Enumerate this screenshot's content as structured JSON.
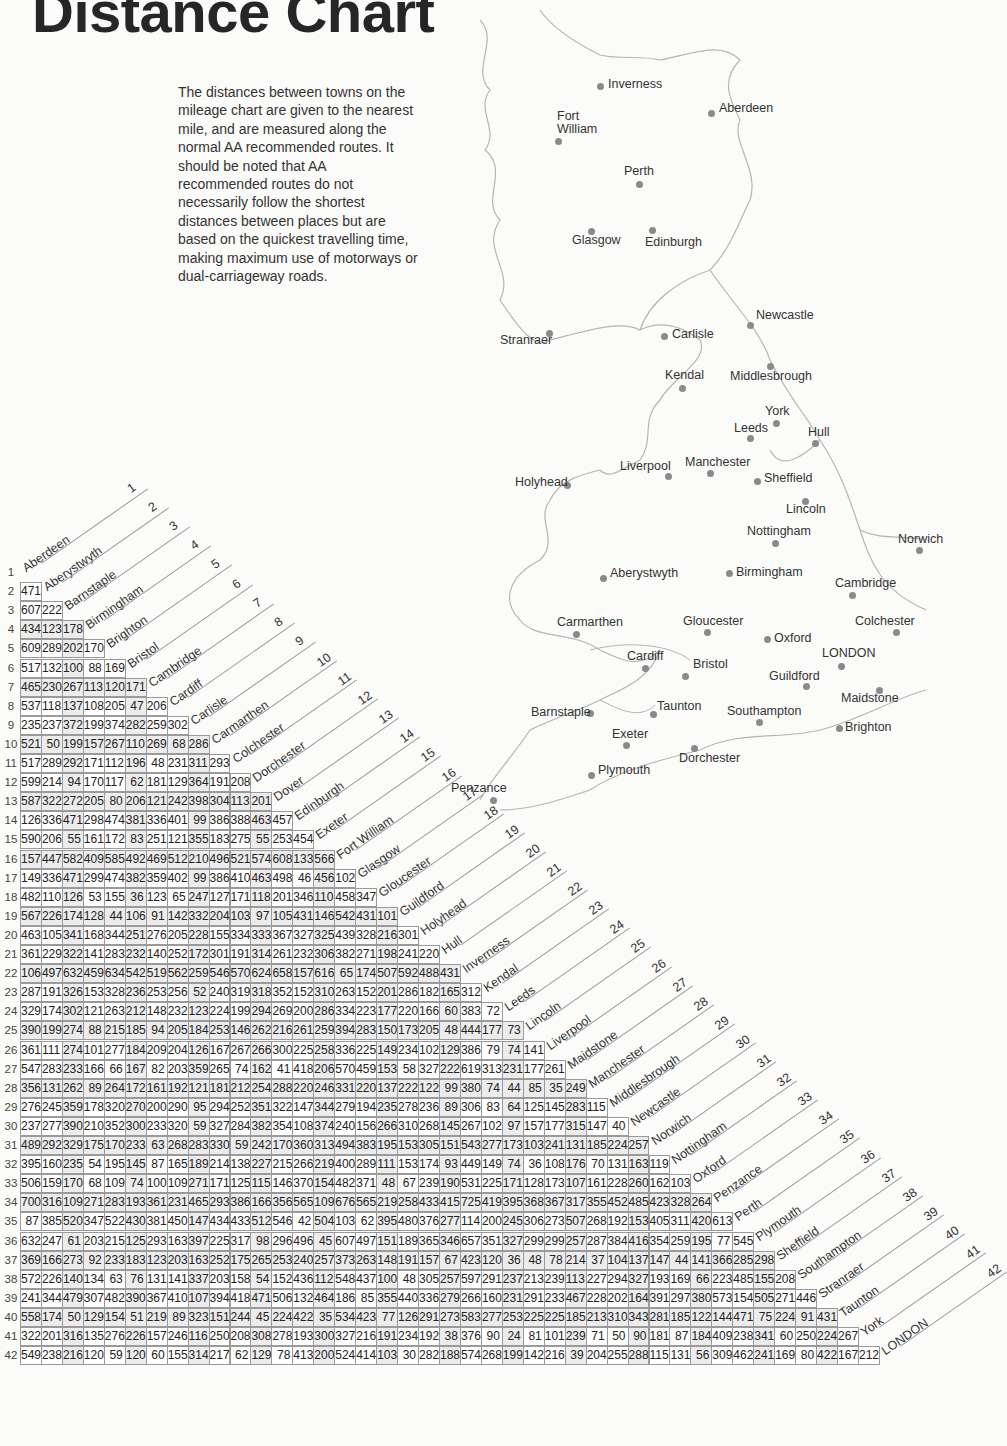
{
  "title": "Distance Chart",
  "intro": "The distances between towns on the mileage chart are given to the nearest mile, and are measured along the normal AA recommended routes. It should be noted  that AA recommended routes do not necessarily follow the shortest distances between places but are based on the quickest travelling time, making maximum use of motorways or dual-carriageway roads.",
  "map": {
    "towns": [
      {
        "name": "Inverness",
        "x": 600,
        "y": 86,
        "lx": 608,
        "ly": 78
      },
      {
        "name": "Aberdeen",
        "x": 711,
        "y": 113,
        "lx": 719,
        "ly": 102
      },
      {
        "name": "Fort\nWilliam",
        "x": 558,
        "y": 141,
        "lx": 557,
        "ly": 110
      },
      {
        "name": "Perth",
        "x": 639,
        "y": 184,
        "lx": 624,
        "ly": 165
      },
      {
        "name": "Glasgow",
        "x": 591,
        "y": 231,
        "lx": 572,
        "ly": 234
      },
      {
        "name": "Edinburgh",
        "x": 652,
        "y": 230,
        "lx": 645,
        "ly": 236
      },
      {
        "name": "Newcastle",
        "x": 750,
        "y": 325,
        "lx": 756,
        "ly": 309
      },
      {
        "name": "Stranraer",
        "x": 549,
        "y": 333,
        "lx": 500,
        "ly": 334
      },
      {
        "name": "Carlisle",
        "x": 664,
        "y": 336,
        "lx": 672,
        "ly": 328
      },
      {
        "name": "Kendal",
        "x": 682,
        "y": 388,
        "lx": 665,
        "ly": 369
      },
      {
        "name": "Middlesbrough",
        "x": 770,
        "y": 366,
        "lx": 730,
        "ly": 370
      },
      {
        "name": "York",
        "x": 776,
        "y": 423,
        "lx": 765,
        "ly": 405
      },
      {
        "name": "Leeds",
        "x": 750,
        "y": 438,
        "lx": 734,
        "ly": 422
      },
      {
        "name": "Hull",
        "x": 815,
        "y": 443,
        "lx": 808,
        "ly": 426
      },
      {
        "name": "Liverpool",
        "x": 668,
        "y": 476,
        "lx": 620,
        "ly": 460
      },
      {
        "name": "Manchester",
        "x": 710,
        "y": 473,
        "lx": 685,
        "ly": 456
      },
      {
        "name": "Sheffield",
        "x": 757,
        "y": 481,
        "lx": 764,
        "ly": 472
      },
      {
        "name": "Holyhead",
        "x": 567,
        "y": 485,
        "lx": 515,
        "ly": 476
      },
      {
        "name": "Lincoln",
        "x": 805,
        "y": 501,
        "lx": 786,
        "ly": 503
      },
      {
        "name": "Nottingham",
        "x": 775,
        "y": 543,
        "lx": 747,
        "ly": 525
      },
      {
        "name": "Norwich",
        "x": 919,
        "y": 550,
        "lx": 898,
        "ly": 533
      },
      {
        "name": "Aberystwyth",
        "x": 603,
        "y": 578,
        "lx": 610,
        "ly": 567
      },
      {
        "name": "Birmingham",
        "x": 729,
        "y": 573,
        "lx": 736,
        "ly": 566
      },
      {
        "name": "Cambridge",
        "x": 852,
        "y": 595,
        "lx": 835,
        "ly": 577
      },
      {
        "name": "Carmarthen",
        "x": 576,
        "y": 634,
        "lx": 557,
        "ly": 616
      },
      {
        "name": "Gloucester",
        "x": 707,
        "y": 632,
        "lx": 683,
        "ly": 615
      },
      {
        "name": "Colchester",
        "x": 896,
        "y": 632,
        "lx": 855,
        "ly": 615
      },
      {
        "name": "Oxford",
        "x": 767,
        "y": 639,
        "lx": 774,
        "ly": 632
      },
      {
        "name": "LONDON",
        "x": 841,
        "y": 666,
        "lx": 822,
        "ly": 647
      },
      {
        "name": "Cardiff",
        "x": 645,
        "y": 668,
        "lx": 627,
        "ly": 650
      },
      {
        "name": "Bristol",
        "x": 685,
        "y": 676,
        "lx": 693,
        "ly": 658
      },
      {
        "name": "Guildford",
        "x": 806,
        "y": 686,
        "lx": 769,
        "ly": 670
      },
      {
        "name": "Maidstone",
        "x": 879,
        "y": 690,
        "lx": 841,
        "ly": 692
      },
      {
        "name": "Barnstaple",
        "x": 590,
        "y": 713,
        "lx": 531,
        "ly": 706
      },
      {
        "name": "Taunton",
        "x": 653,
        "y": 714,
        "lx": 657,
        "ly": 700
      },
      {
        "name": "Southampton",
        "x": 759,
        "y": 722,
        "lx": 727,
        "ly": 705
      },
      {
        "name": "Brighton",
        "x": 839,
        "y": 728,
        "lx": 845,
        "ly": 721
      },
      {
        "name": "Exeter",
        "x": 626,
        "y": 745,
        "lx": 612,
        "ly": 728
      },
      {
        "name": "Dorchester",
        "x": 694,
        "y": 748,
        "lx": 679,
        "ly": 752
      },
      {
        "name": "Plymouth",
        "x": 591,
        "y": 775,
        "lx": 598,
        "ly": 764
      },
      {
        "name": "Penzance",
        "x": 493,
        "y": 800,
        "lx": 451,
        "ly": 782
      }
    ]
  },
  "chart_data": {
    "type": "table",
    "title": "Distance Chart",
    "unit": "miles",
    "towns": [
      "Aberdeen",
      "Aberystwyth",
      "Barnstaple",
      "Birmingham",
      "Brighton",
      "Bristol",
      "Cambridge",
      "Cardiff",
      "Carlisle",
      "Carmarthen",
      "Colchester",
      "Dorchester",
      "Dover",
      "Edinburgh",
      "Exeter",
      "Fort William",
      "Glasgow",
      "Gloucester",
      "Guildford",
      "Holyhead",
      "Hull",
      "Inverness",
      "Kendal",
      "Leeds",
      "Lincoln",
      "Liverpool",
      "Maidstone",
      "Manchester",
      "Middlesbrough",
      "Newcastle",
      "Norwich",
      "Nottingham",
      "Oxford",
      "Penzance",
      "Perth",
      "Plymouth",
      "Sheffield",
      "Southampton",
      "Stranraer",
      "Taunton",
      "York",
      "LONDON"
    ],
    "rows": [
      [],
      [
        471
      ],
      [
        607,
        222
      ],
      [
        434,
        123,
        178
      ],
      [
        609,
        289,
        202,
        170
      ],
      [
        517,
        132,
        100,
        88,
        169
      ],
      [
        465,
        230,
        267,
        113,
        120,
        171
      ],
      [
        537,
        118,
        137,
        108,
        205,
        47,
        206
      ],
      [
        235,
        237,
        372,
        199,
        374,
        282,
        259,
        302
      ],
      [
        521,
        50,
        199,
        157,
        267,
        110,
        269,
        68,
        286
      ],
      [
        517,
        289,
        292,
        171,
        112,
        196,
        48,
        231,
        311,
        293
      ],
      [
        599,
        214,
        94,
        170,
        117,
        62,
        181,
        129,
        364,
        191,
        208
      ],
      [
        587,
        322,
        272,
        205,
        80,
        206,
        121,
        242,
        398,
        304,
        113,
        201
      ],
      [
        126,
        336,
        471,
        298,
        474,
        381,
        336,
        401,
        99,
        386,
        388,
        463,
        457
      ],
      [
        590,
        206,
        55,
        161,
        172,
        83,
        251,
        121,
        355,
        183,
        275,
        55,
        253,
        454
      ],
      [
        157,
        447,
        582,
        409,
        585,
        492,
        469,
        512,
        210,
        496,
        521,
        574,
        608,
        133,
        566
      ],
      [
        149,
        336,
        471,
        299,
        474,
        382,
        359,
        402,
        99,
        386,
        410,
        463,
        498,
        46,
        456,
        102
      ],
      [
        482,
        110,
        126,
        53,
        155,
        36,
        123,
        65,
        247,
        127,
        171,
        118,
        201,
        346,
        110,
        458,
        347
      ],
      [
        567,
        226,
        174,
        128,
        44,
        106,
        91,
        142,
        332,
        204,
        103,
        97,
        105,
        431,
        146,
        542,
        431,
        101
      ],
      [
        463,
        105,
        341,
        168,
        344,
        251,
        276,
        205,
        228,
        155,
        334,
        333,
        367,
        327,
        325,
        439,
        328,
        216,
        301
      ],
      [
        361,
        229,
        322,
        141,
        283,
        232,
        140,
        252,
        172,
        301,
        191,
        314,
        261,
        232,
        306,
        382,
        271,
        198,
        241,
        220
      ],
      [
        106,
        497,
        632,
        459,
        634,
        542,
        519,
        562,
        259,
        546,
        570,
        624,
        658,
        157,
        616,
        65,
        174,
        507,
        592,
        488,
        431
      ],
      [
        287,
        191,
        326,
        153,
        328,
        236,
        253,
        256,
        52,
        240,
        319,
        318,
        352,
        152,
        310,
        263,
        152,
        201,
        286,
        182,
        165,
        312
      ],
      [
        329,
        174,
        302,
        121,
        263,
        212,
        148,
        232,
        123,
        224,
        199,
        294,
        269,
        200,
        286,
        334,
        223,
        177,
        220,
        166,
        60,
        383,
        72
      ],
      [
        390,
        199,
        274,
        88,
        215,
        185,
        94,
        205,
        184,
        253,
        146,
        262,
        216,
        261,
        259,
        394,
        283,
        150,
        173,
        205,
        48,
        444,
        177,
        73
      ],
      [
        361,
        111,
        274,
        101,
        277,
        184,
        209,
        204,
        126,
        167,
        267,
        266,
        300,
        225,
        258,
        336,
        225,
        149,
        234,
        102,
        129,
        386,
        79,
        74,
        141
      ],
      [
        547,
        283,
        233,
        166,
        66,
        167,
        82,
        203,
        359,
        265,
        74,
        162,
        41,
        418,
        206,
        570,
        459,
        153,
        58,
        327,
        222,
        619,
        313,
        231,
        177,
        261
      ],
      [
        356,
        131,
        262,
        89,
        264,
        172,
        161,
        192,
        121,
        181,
        212,
        254,
        288,
        220,
        246,
        331,
        220,
        137,
        222,
        122,
        99,
        380,
        74,
        44,
        85,
        35,
        249
      ],
      [
        276,
        245,
        359,
        178,
        320,
        270,
        200,
        290,
        95,
        294,
        252,
        351,
        322,
        147,
        344,
        279,
        194,
        235,
        278,
        236,
        89,
        306,
        83,
        64,
        125,
        145,
        283,
        115
      ],
      [
        237,
        277,
        390,
        210,
        352,
        300,
        233,
        320,
        59,
        327,
        284,
        382,
        354,
        108,
        374,
        240,
        156,
        266,
        310,
        268,
        145,
        267,
        102,
        97,
        157,
        177,
        315,
        147,
        40
      ],
      [
        489,
        292,
        329,
        175,
        170,
        233,
        63,
        268,
        283,
        330,
        59,
        242,
        170,
        360,
        313,
        494,
        383,
        195,
        153,
        305,
        151,
        543,
        277,
        173,
        103,
        241,
        131,
        185,
        224,
        257
      ],
      [
        395,
        160,
        235,
        54,
        195,
        145,
        87,
        165,
        189,
        214,
        138,
        227,
        215,
        266,
        219,
        400,
        289,
        111,
        153,
        174,
        93,
        449,
        149,
        74,
        36,
        108,
        176,
        70,
        131,
        163,
        119
      ],
      [
        506,
        159,
        170,
        68,
        109,
        74,
        100,
        109,
        271,
        171,
        125,
        115,
        146,
        370,
        154,
        482,
        371,
        48,
        67,
        239,
        190,
        531,
        225,
        171,
        128,
        173,
        107,
        161,
        228,
        260,
        162,
        103
      ],
      [
        700,
        316,
        109,
        271,
        283,
        193,
        361,
        231,
        465,
        293,
        386,
        166,
        356,
        565,
        109,
        676,
        565,
        219,
        258,
        433,
        415,
        725,
        419,
        395,
        368,
        367,
        317,
        355,
        452,
        485,
        423,
        328,
        264
      ],
      [
        87,
        385,
        520,
        347,
        522,
        430,
        381,
        450,
        147,
        434,
        433,
        512,
        546,
        42,
        504,
        103,
        62,
        395,
        480,
        376,
        277,
        114,
        200,
        245,
        306,
        273,
        507,
        268,
        192,
        153,
        405,
        311,
        420,
        613
      ],
      [
        632,
        247,
        61,
        203,
        215,
        125,
        293,
        163,
        397,
        225,
        317,
        98,
        296,
        496,
        45,
        607,
        497,
        151,
        189,
        365,
        346,
        657,
        351,
        327,
        299,
        299,
        257,
        287,
        384,
        416,
        354,
        259,
        195,
        77,
        545
      ],
      [
        369,
        166,
        273,
        92,
        233,
        183,
        123,
        203,
        163,
        252,
        175,
        265,
        253,
        240,
        257,
        373,
        263,
        148,
        191,
        157,
        67,
        423,
        120,
        36,
        48,
        78,
        214,
        37,
        104,
        137,
        147,
        44,
        141,
        366,
        285,
        298
      ],
      [
        572,
        226,
        140,
        134,
        63,
        76,
        131,
        141,
        337,
        203,
        158,
        54,
        152,
        436,
        112,
        548,
        437,
        100,
        48,
        305,
        257,
        597,
        291,
        237,
        213,
        239,
        113,
        227,
        294,
        327,
        193,
        169,
        66,
        223,
        485,
        155,
        208
      ],
      [
        241,
        344,
        479,
        307,
        482,
        390,
        367,
        410,
        107,
        394,
        418,
        471,
        506,
        132,
        464,
        186,
        85,
        355,
        440,
        336,
        279,
        266,
        160,
        231,
        291,
        233,
        467,
        228,
        202,
        164,
        391,
        297,
        380,
        573,
        154,
        505,
        271,
        446
      ],
      [
        558,
        174,
        50,
        129,
        154,
        51,
        219,
        89,
        323,
        151,
        244,
        45,
        224,
        422,
        35,
        534,
        423,
        77,
        126,
        291,
        273,
        583,
        277,
        253,
        225,
        225,
        185,
        213,
        310,
        343,
        281,
        185,
        122,
        144,
        471,
        75,
        224,
        91,
        431
      ],
      [
        322,
        201,
        316,
        135,
        276,
        226,
        157,
        246,
        116,
        250,
        208,
        308,
        278,
        193,
        300,
        327,
        216,
        191,
        234,
        192,
        38,
        376,
        90,
        24,
        81,
        101,
        239,
        71,
        50,
        90,
        181,
        87,
        184,
        409,
        238,
        341,
        60,
        250,
        224,
        267
      ],
      [
        549,
        238,
        216,
        120,
        59,
        120,
        60,
        155,
        314,
        217,
        62,
        129,
        78,
        413,
        200,
        524,
        414,
        103,
        30,
        282,
        188,
        574,
        268,
        199,
        142,
        216,
        39,
        204,
        255,
        288,
        115,
        131,
        56,
        309,
        462,
        241,
        169,
        80,
        422,
        167,
        212
      ]
    ]
  }
}
